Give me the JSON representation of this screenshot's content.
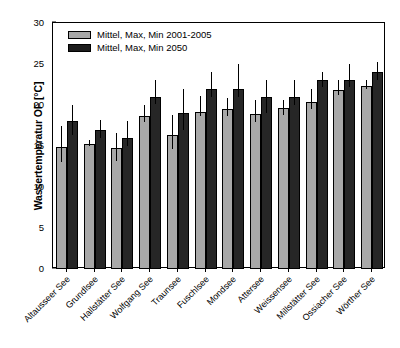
{
  "chart_data": {
    "type": "bar",
    "title": "",
    "xlabel": "",
    "ylabel": "Wassertemperatur OF [°C]",
    "ylim": [
      0,
      30
    ],
    "yticks": [
      0,
      5,
      10,
      15,
      20,
      25,
      30
    ],
    "grid": false,
    "legend_position": "top-left",
    "error_bars": "min-max range (vertical line, no caps)",
    "categories": [
      "Altausseer See",
      "Grundlsee",
      "Hallstätter See",
      "Wolfgang See",
      "Traunsee",
      "Fuschlsee",
      "Mondsee",
      "Attersee",
      "Weissensee",
      "Millstätter See",
      "Ossiacher See",
      "Wörther See"
    ],
    "series": [
      {
        "name": "Mittel, Max, Min 2001-2005",
        "color": "#a8a8a8",
        "values": [
          14.9,
          15.3,
          14.7,
          18.7,
          16.4,
          19.2,
          19.5,
          18.9,
          19.6,
          20.4,
          21.8,
          22.3
        ],
        "err_low": [
          13.1,
          15.0,
          13.2,
          17.9,
          14.6,
          18.6,
          18.6,
          17.9,
          18.8,
          19.5,
          21.2,
          21.9
        ],
        "err_high": [
          17.5,
          15.7,
          16.6,
          20.0,
          18.8,
          21.1,
          20.8,
          20.6,
          20.6,
          22.0,
          23.0,
          23.0
        ]
      },
      {
        "name": "Mittel, Max, Min 2050",
        "color": "#262626",
        "values": [
          18.0,
          17.0,
          16.0,
          21.0,
          19.0,
          22.0,
          22.0,
          21.0,
          21.0,
          23.0,
          23.1,
          24.0
        ],
        "err_low": [
          16.3,
          16.0,
          15.0,
          20.1,
          17.0,
          21.0,
          21.0,
          19.0,
          20.0,
          22.2,
          22.2,
          23.0
        ],
        "err_high": [
          20.0,
          18.2,
          18.0,
          23.0,
          22.0,
          24.0,
          25.0,
          23.0,
          23.0,
          24.0,
          25.0,
          25.2
        ]
      }
    ]
  },
  "legend": {
    "items": [
      {
        "label": "Mittel, Max, Min 2001-2005",
        "swatch": "light"
      },
      {
        "label": "Mittel, Max, Min 2050",
        "swatch": "dark"
      }
    ]
  }
}
